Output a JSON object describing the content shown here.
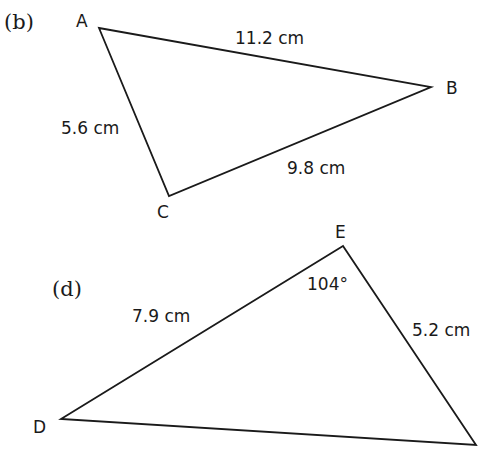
{
  "figures": [
    {
      "part_label": "(b)",
      "vertices": [
        {
          "name": "A",
          "x": 99,
          "y": 28
        },
        {
          "name": "B",
          "x": 431,
          "y": 87
        },
        {
          "name": "C",
          "x": 169,
          "y": 196
        }
      ],
      "sides": [
        {
          "between": "AB",
          "label": "11.2 cm"
        },
        {
          "between": "AC",
          "label": "5.6 cm"
        },
        {
          "between": "BC",
          "label": "9.8 cm"
        }
      ]
    },
    {
      "part_label": "(d)",
      "vertices": [
        {
          "name": "E",
          "x": 343,
          "y": 246
        },
        {
          "name": "D",
          "x": 61,
          "y": 419
        },
        {
          "name": "",
          "x": 476,
          "y": 445
        }
      ],
      "sides": [
        {
          "between": "DE",
          "label": "7.9 cm"
        },
        {
          "between": "E-third",
          "label": "5.2 cm"
        }
      ],
      "angles": [
        {
          "at": "E",
          "label": "104°"
        }
      ]
    }
  ]
}
